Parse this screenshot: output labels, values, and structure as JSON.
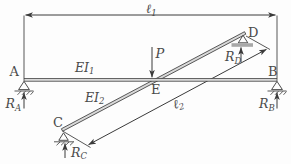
{
  "figure": {
    "colors": {
      "line": "#3a3a3a",
      "text": "#4a4a4a",
      "beam_fill": "#d9d9d9",
      "ground_fill": "#a8a8a8",
      "background": "#fdfdfd"
    }
  },
  "labels": {
    "span1": {
      "base": "ℓ",
      "sub": "1"
    },
    "span2": {
      "base": "ℓ",
      "sub": "2"
    },
    "flexural_rigidity1": {
      "base": "EI",
      "sub": "1"
    },
    "flexural_rigidity2": {
      "base": "EI",
      "sub": "2"
    },
    "load": "P",
    "node_a": "A",
    "node_b": "B",
    "node_c": "C",
    "node_d": "D",
    "node_e": "E",
    "reaction_a": {
      "base": "R",
      "sub": "A"
    },
    "reaction_b": {
      "base": "R",
      "sub": "B"
    },
    "reaction_c": {
      "base": "R",
      "sub": "C"
    },
    "reaction_d": {
      "base": "R",
      "sub": "D"
    }
  }
}
